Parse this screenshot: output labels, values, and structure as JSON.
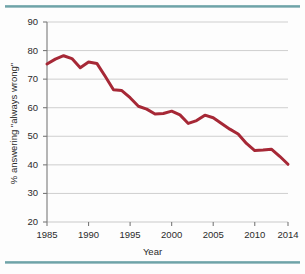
{
  "figure": {
    "background_color": "#fdfdfd",
    "rule_color": "#6fa3a8",
    "top_rule_name": "top-divider",
    "bottom_rule_name": "bottom-divider"
  },
  "chart_data": {
    "type": "line",
    "title": "",
    "subtitle": "",
    "xlabel": "Year",
    "ylabel": "% answering \"always wrong\"",
    "xlim": [
      1985,
      2014
    ],
    "ylim": [
      20,
      90
    ],
    "xticks": [
      1985,
      1990,
      1995,
      2000,
      2005,
      2010,
      2014
    ],
    "xtick_labels": [
      "1985",
      "1990",
      "1995",
      "2000",
      "2005",
      "2010",
      "2014"
    ],
    "yticks": [
      20,
      30,
      40,
      50,
      60,
      70,
      80,
      90
    ],
    "ytick_labels": [
      "20",
      "30",
      "40",
      "50",
      "60",
      "70",
      "80",
      "90"
    ],
    "grid": "horizontal",
    "grid_color": "#c9c9c9",
    "legend": "none",
    "series": [
      {
        "name": "% answering \"always wrong\"",
        "color": "#a62836",
        "line_width": 3,
        "x": [
          1985,
          1986,
          1987,
          1988,
          1989,
          1990,
          1991,
          1992,
          1993,
          1994,
          1995,
          1996,
          1997,
          1998,
          1999,
          2000,
          2001,
          2002,
          2003,
          2004,
          2005,
          2006,
          2007,
          2008,
          2009,
          2010,
          2011,
          2012,
          2013,
          2014
        ],
        "values": [
          75.3,
          77.0,
          78.2,
          77.2,
          74.0,
          76.0,
          75.5,
          71.0,
          66.3,
          66.0,
          63.5,
          60.5,
          59.5,
          57.8,
          58.0,
          58.8,
          57.5,
          54.5,
          55.5,
          57.4,
          56.5,
          54.5,
          52.5,
          50.8,
          47.5,
          45.0,
          45.2,
          45.5,
          43.0,
          40.2
        ]
      }
    ]
  },
  "annotations": {
    "y_axis_name": "y-axis",
    "x_axis_name": "x-axis"
  }
}
